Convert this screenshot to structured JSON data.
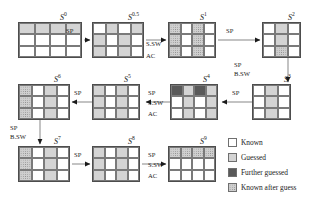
{
  "diagram": {
    "states": [
      {
        "id": "S0",
        "label": "S",
        "sup": "0",
        "cols": 4,
        "rows": 3,
        "x": 18,
        "y": 22,
        "cw": 16,
        "ch": 12,
        "label_x": 60,
        "label_y": 12,
        "cells": [
          "guessed",
          "guessed",
          "guessed",
          "guessed",
          "known",
          "known",
          "known",
          "known",
          "known",
          "known",
          "known",
          "known"
        ]
      },
      {
        "id": "S0.5",
        "label": "S",
        "sup": "0.5",
        "cols": 4,
        "rows": 3,
        "x": 92,
        "y": 22,
        "cw": 13,
        "ch": 12,
        "label_x": 128,
        "label_y": 12,
        "cells": [
          "known",
          "guessed",
          "known",
          "guessed",
          "guessed",
          "known",
          "guessed",
          "known",
          "guessed",
          "known",
          "guessed",
          "known"
        ]
      },
      {
        "id": "S1",
        "label": "S",
        "sup": "1",
        "cols": 4,
        "rows": 3,
        "x": 168,
        "y": 22,
        "cw": 12,
        "ch": 12,
        "label_x": 200,
        "label_y": 12,
        "cells": [
          "after",
          "known",
          "after",
          "known",
          "after",
          "known",
          "after",
          "known",
          "after",
          "known",
          "after",
          "known"
        ]
      },
      {
        "id": "S2",
        "label": "S",
        "sup": "2",
        "cols": 3,
        "rows": 3,
        "x": 262,
        "y": 22,
        "cw": 13,
        "ch": 12,
        "label_x": 288,
        "label_y": 12,
        "cells": [
          "known",
          "guessed",
          "known",
          "known",
          "guessed",
          "known",
          "known",
          "after",
          "known"
        ]
      },
      {
        "id": "S6",
        "label": "S",
        "sup": "6",
        "cols": 4,
        "rows": 3,
        "x": 18,
        "y": 84,
        "cw": 13,
        "ch": 12,
        "label_x": 54,
        "label_y": 74,
        "cells": [
          "after",
          "known",
          "guessed",
          "known",
          "after",
          "known",
          "guessed",
          "known",
          "after",
          "known",
          "guessed",
          "known"
        ]
      },
      {
        "id": "S5",
        "label": "S",
        "sup": "5",
        "cols": 4,
        "rows": 3,
        "x": 92,
        "y": 84,
        "cw": 12,
        "ch": 12,
        "label_x": 124,
        "label_y": 74,
        "cells": [
          "guessed",
          "known",
          "guessed",
          "known",
          "guessed",
          "known",
          "guessed",
          "known",
          "guessed",
          "known",
          "guessed",
          "known"
        ]
      },
      {
        "id": "S4",
        "label": "S",
        "sup": "4",
        "cols": 4,
        "rows": 3,
        "x": 170,
        "y": 84,
        "cw": 12,
        "ch": 12,
        "label_x": 203,
        "label_y": 74,
        "cells": [
          "further",
          "guessed",
          "further",
          "guessed",
          "known",
          "guessed",
          "known",
          "guessed",
          "known",
          "guessed",
          "known",
          "guessed"
        ]
      },
      {
        "id": "S3",
        "label": "S",
        "sup": "3",
        "cols": 3,
        "rows": 3,
        "x": 252,
        "y": 84,
        "cw": 13,
        "ch": 12,
        "label_x": 284,
        "label_y": 74,
        "cells": [
          "known",
          "guessed",
          "known",
          "known",
          "guessed",
          "known",
          "known",
          "guessed",
          "known"
        ]
      },
      {
        "id": "S7",
        "label": "S",
        "sup": "7",
        "cols": 4,
        "rows": 3,
        "x": 18,
        "y": 146,
        "cw": 13,
        "ch": 12,
        "label_x": 54,
        "label_y": 136,
        "cells": [
          "after",
          "known",
          "guessed",
          "known",
          "after",
          "known",
          "guessed",
          "known",
          "after",
          "known",
          "guessed",
          "known"
        ]
      },
      {
        "id": "S8",
        "label": "S",
        "sup": "8",
        "cols": 4,
        "rows": 3,
        "x": 92,
        "y": 146,
        "cw": 12,
        "ch": 12,
        "label_x": 128,
        "label_y": 136,
        "cells": [
          "guessed",
          "known",
          "guessed",
          "known",
          "guessed",
          "known",
          "guessed",
          "known",
          "guessed",
          "known",
          "guessed",
          "known"
        ]
      },
      {
        "id": "S9",
        "label": "S",
        "sup": "9",
        "cols": 4,
        "rows": 3,
        "x": 168,
        "y": 146,
        "cw": 12,
        "ch": 12,
        "label_x": 200,
        "label_y": 136,
        "cells": [
          "after",
          "after",
          "after",
          "after",
          "known",
          "known",
          "known",
          "known",
          "known",
          "known",
          "known",
          "known"
        ]
      }
    ],
    "transitions": [
      {
        "id": "t-s0-s05",
        "label": "SP",
        "x": 66,
        "y": 27
      },
      {
        "id": "t-s05-s1a",
        "label": "S.SW",
        "x": 146,
        "y": 40
      },
      {
        "id": "t-s05-s1b",
        "label": "AC",
        "x": 146,
        "y": 52
      },
      {
        "id": "t-s1-s2",
        "label": "SP",
        "x": 226,
        "y": 27
      },
      {
        "id": "t-s2-s3a",
        "label": "SP",
        "x": 234,
        "y": 61
      },
      {
        "id": "t-s2-s3b",
        "label": "B.SW",
        "x": 234,
        "y": 70
      },
      {
        "id": "t-s5-s6",
        "label": "SP",
        "x": 74,
        "y": 89
      },
      {
        "id": "t-s4-s5a",
        "label": "SP",
        "x": 148,
        "y": 89
      },
      {
        "id": "t-s4-s5b",
        "label": "S.SW",
        "x": 148,
        "y": 99
      },
      {
        "id": "t-s4-s5c",
        "label": "AC",
        "x": 148,
        "y": 110
      },
      {
        "id": "t-s3-s4",
        "label": "SP",
        "x": 232,
        "y": 89
      },
      {
        "id": "t-s6-s7a",
        "label": "SP",
        "x": 10,
        "y": 124
      },
      {
        "id": "t-s6-s7b",
        "label": "B.SW",
        "x": 10,
        "y": 133
      },
      {
        "id": "t-s7-s8",
        "label": "SP",
        "x": 74,
        "y": 151
      },
      {
        "id": "t-s8-s9a",
        "label": "SP",
        "x": 148,
        "y": 151
      },
      {
        "id": "t-s8-s9b",
        "label": "S.SW",
        "x": 148,
        "y": 161
      },
      {
        "id": "t-s8-s9c",
        "label": "AC",
        "x": 148,
        "y": 172
      }
    ]
  },
  "legend": {
    "x": 228,
    "y": 138,
    "row_height": 15,
    "items": [
      {
        "id": "legend-known",
        "label": "Known",
        "fill": "known",
        "color": "#ffffff"
      },
      {
        "id": "legend-guessed",
        "label": "Guessed",
        "fill": "guessed",
        "color": "#d4d4d4"
      },
      {
        "id": "legend-further-guessed",
        "label": "Further guessed",
        "fill": "further",
        "color": "#595959"
      },
      {
        "id": "legend-known-after-guess",
        "label": "Known after guess",
        "fill": "after",
        "color": "#cfcfcf"
      }
    ]
  },
  "colors": {
    "known": "#ffffff",
    "guessed": "#d4d4d4",
    "further_guessed": "#595959",
    "known_after_guess": "#cfcfcf",
    "grid_line": "#7a7a7a",
    "border": "#4d4d4d",
    "text": "#1a1a1a",
    "background": "#ffffff"
  }
}
